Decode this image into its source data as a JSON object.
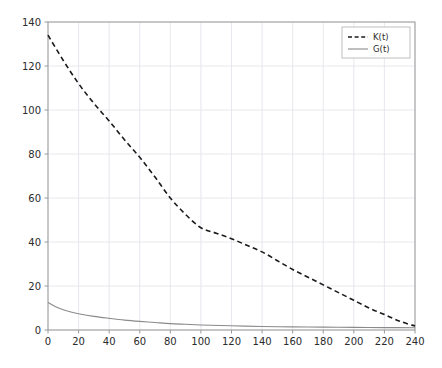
{
  "chart_data": {
    "type": "line",
    "title": "",
    "xlabel": "",
    "ylabel": "",
    "xlim": [
      0,
      240
    ],
    "ylim": [
      0,
      140
    ],
    "xticks": [
      0,
      20,
      40,
      60,
      80,
      100,
      120,
      140,
      160,
      180,
      200,
      220,
      240
    ],
    "yticks": [
      0,
      20,
      40,
      60,
      80,
      100,
      120,
      140
    ],
    "grid": true,
    "legend_position": "upper right",
    "background": "#ffffff",
    "grid_color": "#e2e2ea",
    "axis_color": "#9a9a9a",
    "series": [
      {
        "name": "K(t)",
        "color": "#1a1a1a",
        "linestyle": "dashed",
        "linewidth": 1.6,
        "x": [
          0,
          10,
          20,
          30,
          40,
          50,
          60,
          70,
          80,
          90,
          100,
          110,
          120,
          130,
          140,
          150,
          160,
          170,
          180,
          190,
          200,
          210,
          220,
          230,
          240
        ],
        "y": [
          134.0,
          122.5,
          112.0,
          103.0,
          95.0,
          86.5,
          78.5,
          69.5,
          60.0,
          52.5,
          46.5,
          44.0,
          41.5,
          38.5,
          35.5,
          31.5,
          27.5,
          24.0,
          20.5,
          17.0,
          13.5,
          10.0,
          7.0,
          4.0,
          1.8
        ]
      },
      {
        "name": "G(t)",
        "color": "#8a8a8a",
        "linestyle": "solid",
        "linewidth": 1.1,
        "x": [
          0,
          5,
          10,
          15,
          20,
          30,
          40,
          50,
          60,
          70,
          80,
          90,
          100,
          120,
          140,
          160,
          180,
          200,
          220,
          240
        ],
        "y": [
          12.5,
          10.6,
          9.2,
          8.2,
          7.4,
          6.2,
          5.3,
          4.5,
          3.9,
          3.4,
          2.9,
          2.6,
          2.3,
          1.9,
          1.6,
          1.4,
          1.3,
          1.2,
          1.1,
          1.0
        ]
      }
    ]
  },
  "legend": {
    "entries": [
      {
        "label": "K(t)",
        "style": "dashed"
      },
      {
        "label": "G(t)",
        "style": "solid"
      }
    ]
  }
}
